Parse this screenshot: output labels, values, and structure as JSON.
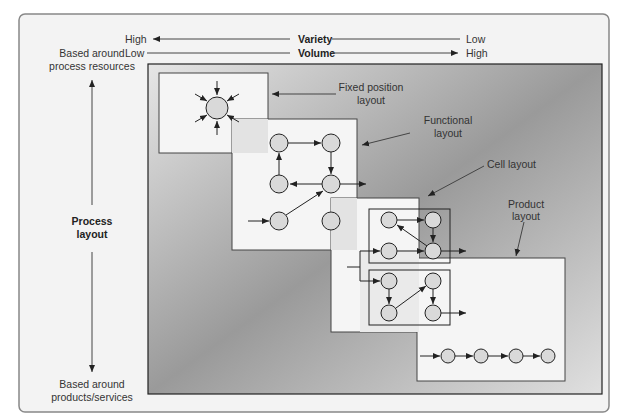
{
  "axes": {
    "variety": {
      "label": "Variety",
      "left": "High",
      "right": "Low"
    },
    "volume": {
      "label": "Volume",
      "left": "Low",
      "right": "High"
    }
  },
  "vertical_axis": {
    "top_line1": "Based around",
    "top_line2": "process resources",
    "middle_line1": "Process",
    "middle_line2": "layout",
    "bottom_line1": "Based around",
    "bottom_line2": "products/services"
  },
  "layouts": {
    "fixed_position": {
      "line1": "Fixed position",
      "line2": "layout"
    },
    "functional": {
      "line1": "Functional",
      "line2": "layout"
    },
    "cell": {
      "line1": "Cell layout"
    },
    "product": {
      "line1": "Product",
      "line2": "layout"
    }
  },
  "colors": {
    "frame_bg": "#f2f2f2",
    "panel_light": "#f7f7f7",
    "node_fill": "#d9d9d9",
    "line": "#222222"
  }
}
